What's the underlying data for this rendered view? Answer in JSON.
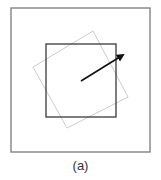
{
  "figure": {
    "caption": "(a)",
    "outer_square": {
      "x": 11,
      "y": 8,
      "width": 139,
      "height": 144,
      "stroke": "#7a7a7a"
    },
    "inner_square": {
      "x": 46,
      "y": 44,
      "width": 70,
      "height": 73,
      "stroke": "#3a3a3a"
    },
    "rotated_square": {
      "points": "93,31 128,97 67,128 33,67",
      "stroke": "#cccccc"
    },
    "arrow": {
      "x1": 81,
      "y1": 81,
      "x2": 123,
      "y2": 55,
      "stroke": "#111111"
    }
  }
}
